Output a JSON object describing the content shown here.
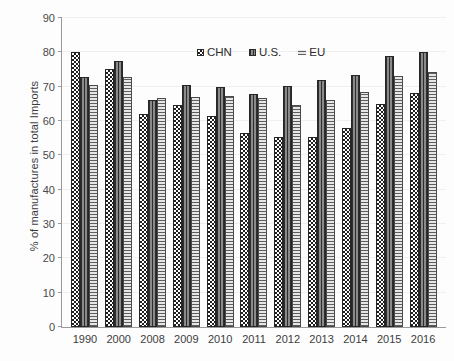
{
  "chart_data": {
    "type": "bar",
    "title": "",
    "xlabel": "",
    "ylabel": "% of manufactures in total Imports",
    "ylim": [
      0,
      90
    ],
    "ytick_step": 10,
    "yticks": [
      0,
      10,
      20,
      30,
      40,
      50,
      60,
      70,
      80,
      90
    ],
    "grid": true,
    "legend_position": "top-center",
    "categories": [
      "1990",
      "2000",
      "2008",
      "2009",
      "2010",
      "2011",
      "2012",
      "2013",
      "2014",
      "2015",
      "2016"
    ],
    "series": [
      {
        "name": "CHN",
        "pattern": "checkerboard",
        "color": "#1f1f1f",
        "values": [
          80.0,
          75.2,
          62.0,
          64.6,
          61.5,
          56.6,
          55.2,
          55.2,
          58.0,
          64.9,
          68.3
        ]
      },
      {
        "name": "U.S.",
        "pattern": "vertical-stripes",
        "color": "#6d6d6d",
        "values": [
          72.9,
          77.4,
          66.1,
          70.4,
          70.0,
          68.0,
          70.1,
          71.9,
          73.4,
          79.0,
          80.0
        ]
      },
      {
        "name": "EU",
        "pattern": "horizontal-stripes",
        "color": "#d2d2d2",
        "values": [
          70.5,
          72.8,
          66.8,
          66.9,
          67.3,
          66.8,
          64.7,
          66.0,
          68.5,
          73.0,
          74.3
        ]
      }
    ]
  },
  "legend": {
    "items": [
      {
        "label": "CHN",
        "key": "chn"
      },
      {
        "label": "U.S.",
        "key": "us"
      },
      {
        "label": "EU",
        "key": "eu"
      }
    ]
  }
}
